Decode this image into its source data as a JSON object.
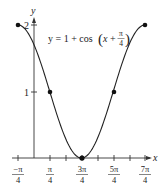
{
  "chart_data": {
    "type": "line",
    "title": "",
    "equation": {
      "prefix": "y = 1 + cos",
      "arg_x": "x",
      "arg_plus": "+",
      "frac_num": "π",
      "frac_den": "4"
    },
    "xlabel": "x",
    "ylabel": "y",
    "x_ticks": [
      {
        "num": "−π",
        "den": "4",
        "value": -0.7854
      },
      {
        "num": "π",
        "den": "4",
        "value": 0.7854
      },
      {
        "num": "3π",
        "den": "4",
        "value": 2.3562
      },
      {
        "num": "5π",
        "den": "4",
        "value": 3.927
      },
      {
        "num": "7π",
        "den": "4",
        "value": 5.4978
      }
    ],
    "y_ticks": [
      {
        "label": "1",
        "value": 1
      },
      {
        "label": "2",
        "value": 2
      }
    ],
    "xlim": [
      -0.7854,
      5.4978
    ],
    "ylim": [
      0,
      2
    ],
    "grid": false,
    "series": [
      {
        "name": "y = 1 + cos(x + π/4)",
        "x": [
          -0.7854,
          0.7854,
          2.3562,
          3.927,
          5.4978
        ],
        "y": [
          2,
          1,
          0,
          1,
          2
        ],
        "marked_points": true
      }
    ]
  }
}
